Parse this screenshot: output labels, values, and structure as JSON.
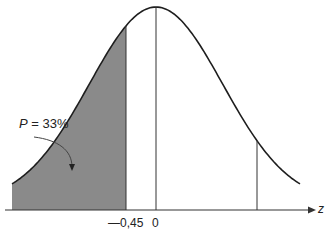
{
  "chart_data": {
    "type": "area",
    "title": "",
    "xlabel": "z",
    "ylabel": "",
    "distribution": {
      "name": "standard normal",
      "mean": 0,
      "sd": 1
    },
    "shaded_region": {
      "from": "-inf",
      "to": -0.45,
      "probability_percent": 33
    },
    "vertical_lines": [
      -0.45,
      0,
      1.55
    ],
    "tick_labels": [
      "—0,45",
      "0"
    ],
    "annotations": [
      {
        "text": "P = 33%",
        "points_to": "shaded left tail"
      }
    ],
    "grid": false,
    "legend": null,
    "colors": {
      "curve": "#1e1e1e",
      "shade": "#8a8a8a",
      "axis": "#333333"
    }
  },
  "labels": {
    "p_label_var": "P",
    "p_label_rest": " = 33%",
    "tick_neg": "—0,45",
    "tick_zero": "0",
    "axis_z": "z"
  }
}
